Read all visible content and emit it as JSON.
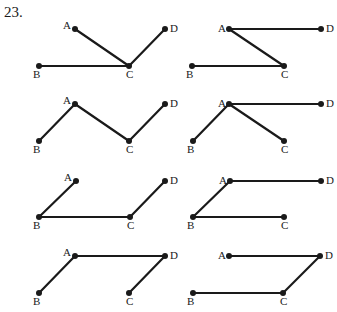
{
  "problem": {
    "number": "23."
  },
  "style": {
    "ink": "#1a1a1a",
    "background": "#ffffff",
    "stroke_width": 2.2,
    "dot_radius": 3
  },
  "panels": [
    {
      "id": "r1c1",
      "points": {
        "A": [
          75,
          29
        ],
        "D": [
          165,
          29
        ],
        "B": [
          39,
          66
        ],
        "C": [
          129,
          66
        ]
      },
      "labels": {
        "A": [
          -12,
          0
        ],
        "D": [
          5,
          3
        ],
        "B": [
          -6,
          12
        ],
        "C": [
          -3,
          12
        ]
      },
      "edges": [
        [
          "A",
          "C"
        ],
        [
          "B",
          "C"
        ],
        [
          "C",
          "D"
        ]
      ]
    },
    {
      "id": "r1c2",
      "points": {
        "A": [
          229,
          29
        ],
        "D": [
          321,
          29
        ],
        "B": [
          192,
          66
        ],
        "C": [
          284,
          66
        ]
      },
      "labels": {
        "A": [
          -11,
          3
        ],
        "D": [
          5,
          3
        ],
        "B": [
          -6,
          12
        ],
        "C": [
          -3,
          12
        ]
      },
      "edges": [
        [
          "A",
          "D"
        ],
        [
          "A",
          "C"
        ],
        [
          "B",
          "C"
        ]
      ]
    },
    {
      "id": "r2c1",
      "points": {
        "A": [
          75,
          104
        ],
        "D": [
          165,
          104
        ],
        "B": [
          39,
          141
        ],
        "C": [
          129,
          141
        ]
      },
      "labels": {
        "A": [
          -12,
          0
        ],
        "D": [
          5,
          3
        ],
        "B": [
          -6,
          12
        ],
        "C": [
          -3,
          12
        ]
      },
      "edges": [
        [
          "B",
          "A"
        ],
        [
          "A",
          "C"
        ],
        [
          "C",
          "D"
        ]
      ]
    },
    {
      "id": "r2c2",
      "points": {
        "A": [
          229,
          104
        ],
        "D": [
          321,
          104
        ],
        "B": [
          193,
          141
        ],
        "C": [
          284,
          141
        ]
      },
      "labels": {
        "A": [
          -11,
          3
        ],
        "D": [
          5,
          3
        ],
        "B": [
          -6,
          12
        ],
        "C": [
          -3,
          12
        ]
      },
      "edges": [
        [
          "A",
          "D"
        ],
        [
          "A",
          "B"
        ],
        [
          "A",
          "C"
        ]
      ]
    },
    {
      "id": "r3c1",
      "points": {
        "A": [
          76,
          181
        ],
        "D": [
          165,
          181
        ],
        "B": [
          39,
          217
        ],
        "C": [
          130,
          217
        ]
      },
      "labels": {
        "A": [
          -12,
          0
        ],
        "D": [
          5,
          3
        ],
        "B": [
          -6,
          12
        ],
        "C": [
          -3,
          12
        ]
      },
      "edges": [
        [
          "B",
          "A"
        ],
        [
          "B",
          "C"
        ],
        [
          "C",
          "D"
        ]
      ]
    },
    {
      "id": "r3c2",
      "points": {
        "A": [
          230,
          181
        ],
        "D": [
          321,
          181
        ],
        "B": [
          193,
          217
        ],
        "C": [
          284,
          217
        ]
      },
      "labels": {
        "A": [
          -11,
          3
        ],
        "D": [
          5,
          3
        ],
        "B": [
          -6,
          12
        ],
        "C": [
          -3,
          12
        ]
      },
      "edges": [
        [
          "A",
          "D"
        ],
        [
          "A",
          "B"
        ],
        [
          "B",
          "C"
        ]
      ]
    },
    {
      "id": "r4c1",
      "points": {
        "A": [
          75,
          256
        ],
        "D": [
          165,
          256
        ],
        "B": [
          39,
          293
        ],
        "C": [
          129,
          293
        ]
      },
      "labels": {
        "A": [
          -12,
          0
        ],
        "D": [
          5,
          3
        ],
        "B": [
          -6,
          12
        ],
        "C": [
          -3,
          12
        ]
      },
      "edges": [
        [
          "A",
          "D"
        ],
        [
          "B",
          "A"
        ],
        [
          "C",
          "D"
        ]
      ]
    },
    {
      "id": "r4c2",
      "points": {
        "A": [
          229,
          256
        ],
        "D": [
          320,
          256
        ],
        "B": [
          193,
          293
        ],
        "C": [
          283,
          293
        ]
      },
      "labels": {
        "A": [
          -11,
          3
        ],
        "D": [
          5,
          3
        ],
        "B": [
          -6,
          12
        ],
        "C": [
          -3,
          12
        ]
      },
      "edges": [
        [
          "A",
          "D"
        ],
        [
          "D",
          "C"
        ],
        [
          "B",
          "C"
        ]
      ]
    }
  ]
}
